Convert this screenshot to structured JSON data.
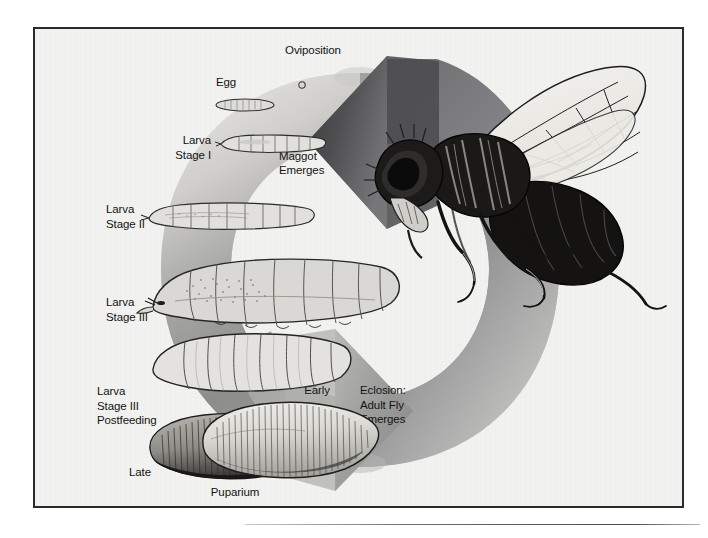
{
  "figure": {
    "background_color": "#f2f2f0",
    "border_color": "#2b2b2b"
  },
  "labels": {
    "oviposition": "Oviposition",
    "egg": "Egg",
    "eclosion_maggot": "Eclosion:\nMaggot\nEmerges",
    "larva_stage_1": "Larva\nStage I",
    "larva_stage_2": "Larva\nStage II",
    "larva_stage_3": "Larva\nStage III",
    "larva_stage_3_postfeeding": "Larva\nStage III\nPostfeeding",
    "early": "Early",
    "late": "Late",
    "puparium": "Puparium",
    "eclosion_adult": "Eclosion:\nAdult Fly\nEmerges"
  },
  "illustrations": {
    "adult_fly": "adult-fly-illustration",
    "egg_dot": "egg-dot",
    "egg_oval": "egg-illustration",
    "larva1": "larva-stage-1-illustration",
    "larva2": "larva-stage-2-illustration",
    "larva3": "larva-stage-3-illustration",
    "larva3pf": "larva-stage-3-postfeeding-illustration",
    "puparium_late": "puparium-late-illustration",
    "puparium_early": "puparium-early-illustration"
  },
  "ring": {
    "arrow_top_direction": "left",
    "arrow_bottom_direction": "right",
    "light_color": "#e2e1de",
    "mid_color": "#9a9a98",
    "dark_color": "#5d5d5f"
  },
  "caption": {
    "ghost_line": "",
    "rule_line": "",
    "text": ""
  }
}
